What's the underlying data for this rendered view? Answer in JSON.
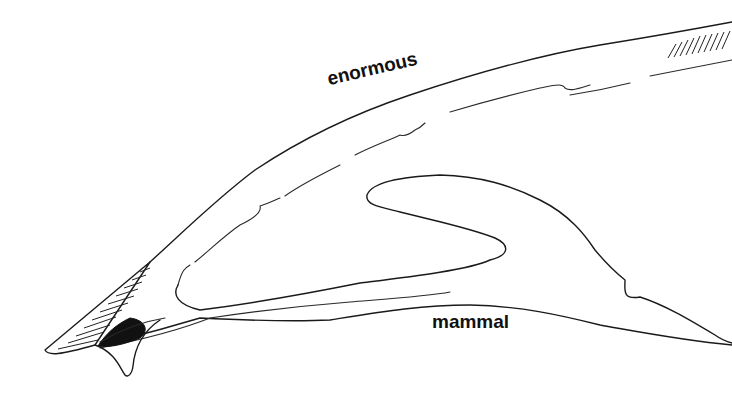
{
  "figure": {
    "stroke_color": "#1a1a1a",
    "background_color": "#ffffff"
  },
  "labels": {
    "top": "enormous",
    "bottom": "mammal"
  }
}
